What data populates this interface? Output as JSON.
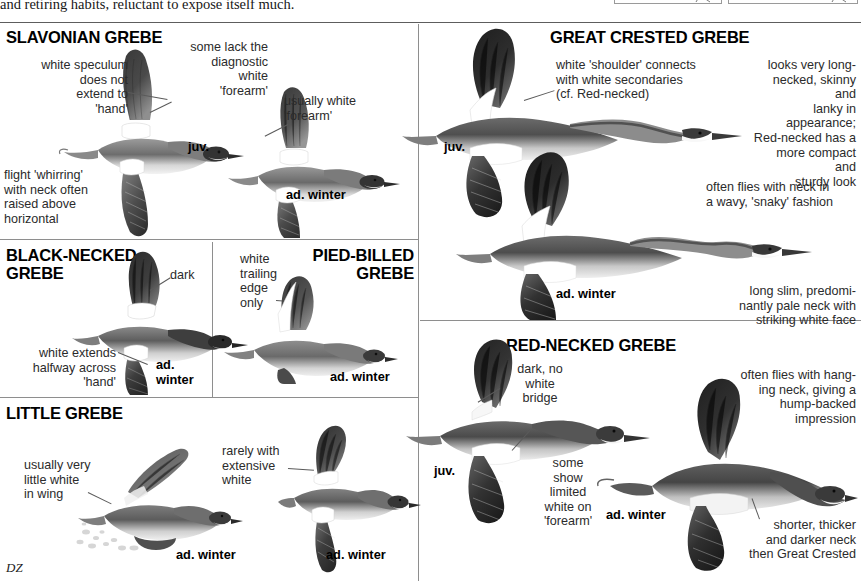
{
  "page": {
    "running_text": "and retiring habits, reluctant to expose itself much.",
    "artist_signature": "DZ"
  },
  "panels": [
    {
      "id": "slavonian",
      "heading": "SLAVONIAN GREBE",
      "notes": [
        "white speculum does not extend to 'hand'",
        "some lack the diagnostic white 'forearm'",
        "usually white 'forearm'",
        "flight 'whirring' with neck often raised above horizontal"
      ],
      "age_labels": [
        "juv.",
        "ad. winter"
      ]
    },
    {
      "id": "black-necked",
      "heading": "BLACK-NECKED GREBE",
      "notes": [
        "dark",
        "white extends halfway across 'hand'"
      ],
      "age_labels": [
        "ad. winter"
      ]
    },
    {
      "id": "pied-billed",
      "heading": "PIED-BILLED GREBE",
      "notes": [
        "white trailing edge only"
      ],
      "age_labels": [
        "ad. winter"
      ]
    },
    {
      "id": "little",
      "heading": "LITTLE GREBE",
      "notes": [
        "usually very little white in wing",
        "rarely with extensive white"
      ],
      "age_labels": [
        "ad. winter",
        "ad. winter"
      ]
    },
    {
      "id": "great-crested",
      "heading": "GREAT CRESTED GREBE",
      "notes": [
        "white 'shoulder' connects with white secondaries (cf. Red-necked)",
        "looks very long-necked, skinny and lanky in appearance; Red-necked has a more compact and sturdy look",
        "often flies with neck in a wavy, 'snaky' fashion",
        "long slim, predominantly pale neck with striking white face"
      ],
      "age_labels": [
        "juv.",
        "ad. winter"
      ]
    },
    {
      "id": "red-necked",
      "heading": "RED-NECKED GREBE",
      "notes": [
        "dark, no white bridge",
        "often flies with hanging neck, giving a hump-backed impression",
        "some show limited white on 'forearm'",
        "shorter, thicker and darker neck then Great Crested"
      ],
      "age_labels": [
        "juv.",
        "ad. winter"
      ]
    }
  ],
  "text": {
    "slav_heading": "SLAVONIAN GREBE",
    "slav_note1": "white speculum\ndoes not\nextend to\n'hand'",
    "slav_note1_l1": "white speculum",
    "slav_note1_l2": "does not",
    "slav_note1_l3": "extend to",
    "slav_note1_l4": "'hand'",
    "slav_note2_l1": "some lack the",
    "slav_note2_l2": "diagnostic",
    "slav_note2_l3": "white",
    "slav_note2_l4": "'forearm'",
    "slav_note3_l1": "usually white",
    "slav_note3_l2": "'forearm'",
    "slav_note4_l1": "flight 'whirring'",
    "slav_note4_l2": "with neck often",
    "slav_note4_l3": "raised above",
    "slav_note4_l4": "horizontal",
    "slav_juv": "juv.",
    "slav_adwinter": "ad. winter",
    "bn_heading_l1": "BLACK-NECKED",
    "bn_heading_l2": "GREBE",
    "bn_note_dark": "dark",
    "bn_note2_l1": "white extends",
    "bn_note2_l2": "halfway across",
    "bn_note2_l3": "'hand'",
    "bn_ad": "ad.",
    "bn_winter": "winter",
    "pb_heading_l1": "PIED-BILLED",
    "pb_heading_l2": "GREBE",
    "pb_note_l1": "white",
    "pb_note_l2": "trailing",
    "pb_note_l3": "edge",
    "pb_note_l4": "only",
    "pb_adwinter": "ad. winter",
    "lg_heading": "LITTLE GREBE",
    "lg_note1_l1": "usually very",
    "lg_note1_l2": "little white",
    "lg_note1_l3": "in wing",
    "lg_note2_l1": "rarely with",
    "lg_note2_l2": "extensive",
    "lg_note2_l3": "white",
    "lg_adwinter1": "ad. winter",
    "lg_adwinter2": "ad. winter",
    "gc_heading": "GREAT CRESTED GREBE",
    "gc_note1_l1": "white 'shoulder' connects",
    "gc_note1_l2": "with white secondaries",
    "gc_note1_l3": "(cf. Red-necked)",
    "gc_note2_l1": "looks very long-",
    "gc_note2_l2": "necked, skinny and",
    "gc_note2_l3": "lanky in appearance;",
    "gc_note2_l4": "Red-necked has a",
    "gc_note2_l5": "more compact and",
    "gc_note2_l6": "sturdy look",
    "gc_note3_l1": "often flies with neck in",
    "gc_note3_l2": "a wavy, 'snaky' fashion",
    "gc_note4_l1": "long slim, predomi-",
    "gc_note4_l2": "nantly pale neck with",
    "gc_note4_l3": "striking white face",
    "gc_juv": "juv.",
    "gc_adwinter": "ad. winter",
    "rn_heading": "RED-NECKED GREBE",
    "rn_note1_l1": "dark, no",
    "rn_note1_l2": "white",
    "rn_note1_l3": "bridge",
    "rn_note2_l1": "often flies with hang-",
    "rn_note2_l2": "ing neck, giving a",
    "rn_note2_l3": "hump-backed",
    "rn_note2_l4": "impression",
    "rn_note3_l1": "some",
    "rn_note3_l2": "show",
    "rn_note3_l3": "limited",
    "rn_note3_l4": "white on",
    "rn_note3_l5": "'forearm'",
    "rn_note4_l1": "shorter, thicker",
    "rn_note4_l2": "and darker neck",
    "rn_note4_l3": "then Great Crested",
    "rn_juv": "juv.",
    "rn_adwinter": "ad. winter"
  },
  "colors": {
    "page_bg": "#ffffff",
    "text": "#2b2b2b",
    "heading": "#000000",
    "rule": "#5d5d5d",
    "bird_dark": "#2e2e2e",
    "bird_mid": "#6e6e6e",
    "bird_light": "#b9b9b9",
    "bird_white": "#ffffff"
  }
}
